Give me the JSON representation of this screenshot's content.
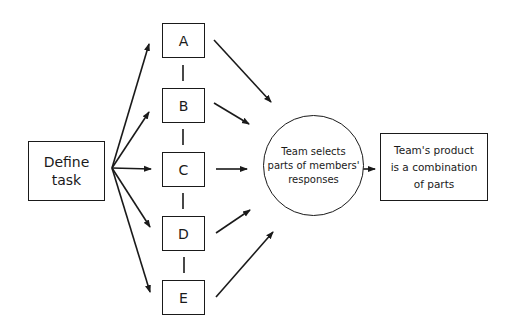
{
  "diagram": {
    "start": {
      "label_line1": "Define",
      "label_line2": "task"
    },
    "members": [
      {
        "label": "A"
      },
      {
        "label": "B"
      },
      {
        "label": "C"
      },
      {
        "label": "D"
      },
      {
        "label": "E"
      }
    ],
    "selection": {
      "line1": "Team selects",
      "line2": "parts of members'",
      "line3": "responses"
    },
    "product": {
      "line1": "Team's product",
      "line2": "is a combination",
      "line3": "of parts"
    },
    "colors": {
      "stroke": "#1a1a1a",
      "background": "#ffffff"
    }
  }
}
